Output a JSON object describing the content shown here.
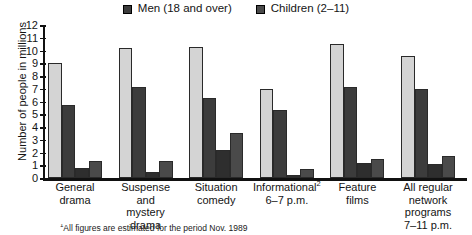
{
  "chart_data": {
    "type": "bar",
    "title": "",
    "xlabel": "",
    "ylabel": "Number of people in millions",
    "ylim": [
      0,
      12
    ],
    "ytick_labels": [
      "12",
      "11",
      "10",
      "9",
      "8",
      "7",
      "6",
      "5",
      "4",
      "3",
      "2",
      "1",
      "0"
    ],
    "ytick_values": [
      12,
      11,
      10,
      9,
      8,
      7,
      6,
      5,
      4,
      3,
      2,
      1,
      0
    ],
    "grid": false,
    "legend_position": "top-center",
    "categories": [
      "General drama",
      "Suspense and mystery drama",
      "Situation comedy",
      "Informational² 6–7 p.m.",
      "Feature films",
      "All regular network programs 7–11 p.m."
    ],
    "series": [
      {
        "name": "Women (18 and over)",
        "color": "#d4d4d4",
        "values": [
          9.0,
          10.2,
          10.3,
          7.0,
          10.5,
          9.6
        ]
      },
      {
        "name": "Men (18 and over)",
        "color": "#3c3c3c",
        "values": [
          5.7,
          7.1,
          6.3,
          5.3,
          7.1,
          7.0
        ]
      },
      {
        "name": "Teens (12–17)",
        "color": "#2e2e2e",
        "values": [
          0.8,
          0.5,
          2.2,
          0.2,
          1.2,
          1.1
        ]
      },
      {
        "name": "Children (2–11)",
        "color": "#4a4a4a",
        "values": [
          1.3,
          1.3,
          3.5,
          0.7,
          1.5,
          1.7
        ]
      }
    ],
    "annotations": {
      "footnote": "All figures are estimated for the period Nov. 1989",
      "footnote_marker": "1"
    }
  },
  "legend": {
    "items": [
      {
        "label": "Men (18 and over)",
        "color": "#3c3c3c"
      },
      {
        "label": "Children (2–11)",
        "color": "#4a4a4a"
      }
    ]
  },
  "axis": {
    "y_title": "Number of people in millions"
  },
  "categories_display": [
    {
      "lines": [
        "General",
        "drama"
      ]
    },
    {
      "lines": [
        "Suspense and",
        "mystery",
        "drama"
      ]
    },
    {
      "lines": [
        "Situation",
        "comedy"
      ]
    },
    {
      "lines": [
        "Informational",
        "6–7 p.m."
      ],
      "sup": "2"
    },
    {
      "lines": [
        "Feature",
        "films"
      ]
    },
    {
      "lines": [
        "All regular",
        "network",
        "programs",
        "7–11 p.m."
      ]
    }
  ]
}
